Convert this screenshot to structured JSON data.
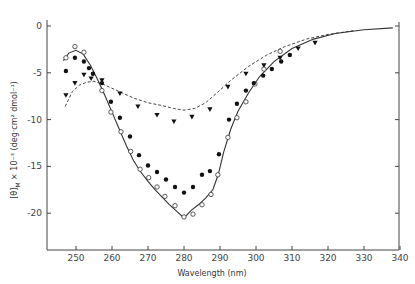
{
  "chart_data": {
    "type": "scatter",
    "title": "",
    "xlabel": "Wavelength (nm)",
    "ylabel": "[θ]M × 10⁻³ (deg·cm² dmol⁻¹)",
    "xlim": [
      242,
      340
    ],
    "ylim": [
      -24,
      2
    ],
    "x_ticks": [
      250,
      260,
      270,
      280,
      290,
      300,
      310,
      320,
      330,
      340
    ],
    "y_ticks": [
      0,
      -5,
      -10,
      -15,
      -20
    ],
    "grid": false,
    "legend": null,
    "series": [
      {
        "name": "open circles",
        "marker": "open-circle",
        "points": [
          [
            247.2,
            -3.4
          ],
          [
            249.7,
            -2.2
          ],
          [
            252.2,
            -2.8
          ],
          [
            257.2,
            -6.9
          ],
          [
            259.7,
            -9.2
          ],
          [
            262.5,
            -11.3
          ],
          [
            265.2,
            -13.4
          ],
          [
            267.8,
            -15.3
          ],
          [
            270.2,
            -16.2
          ],
          [
            272.5,
            -17.2
          ],
          [
            274.7,
            -18.2
          ],
          [
            277.5,
            -19.2
          ],
          [
            280,
            -20.4
          ],
          [
            282.5,
            -20.1
          ],
          [
            285,
            -19.1
          ],
          [
            287.5,
            -18
          ],
          [
            289.4,
            -15.9
          ],
          [
            292.2,
            -11.9
          ],
          [
            294.7,
            -9.8
          ],
          [
            297.2,
            -8.1
          ],
          [
            299.7,
            -6.2
          ],
          [
            302.2,
            -4.6
          ],
          [
            306.7,
            -2.7
          ]
        ]
      },
      {
        "name": "filled circles",
        "marker": "filled-circle",
        "points": [
          [
            247.2,
            -4.8
          ],
          [
            249.7,
            -3.4
          ],
          [
            252.2,
            -3.8
          ],
          [
            253.6,
            -4.5
          ],
          [
            254.7,
            -5.1
          ],
          [
            257.2,
            -6.1
          ],
          [
            259.7,
            -8.1
          ],
          [
            262.2,
            -9.8
          ],
          [
            265,
            -11.8
          ],
          [
            267.5,
            -13.8
          ],
          [
            270,
            -14.9
          ],
          [
            272.5,
            -15.6
          ],
          [
            275,
            -16.4
          ],
          [
            277.5,
            -17.2
          ],
          [
            280,
            -17.8
          ],
          [
            282.5,
            -17.2
          ],
          [
            285,
            -15.9
          ],
          [
            287.2,
            -15.5
          ],
          [
            289.7,
            -13.7
          ],
          [
            292.5,
            -10.0
          ],
          [
            294.7,
            -8.3
          ],
          [
            297.2,
            -6.9
          ],
          [
            299.4,
            -6.1
          ],
          [
            302,
            -5.3
          ],
          [
            304.4,
            -4.6
          ],
          [
            307,
            -3.8
          ],
          [
            309.4,
            -3.1
          ]
        ]
      },
      {
        "name": "filled triangles",
        "marker": "filled-triangle-down",
        "points": [
          [
            247.2,
            -7.4
          ],
          [
            249.7,
            -6.1
          ],
          [
            252.2,
            -5.2
          ],
          [
            254.2,
            -5.6
          ],
          [
            257.2,
            -5.8
          ],
          [
            262.2,
            -7.2
          ],
          [
            267.2,
            -8.6
          ],
          [
            272.5,
            -9.5
          ],
          [
            277.2,
            -10.2
          ],
          [
            282.2,
            -9.7
          ],
          [
            287.2,
            -8.9
          ],
          [
            292.2,
            -6.5
          ],
          [
            297.2,
            -5.1
          ],
          [
            302.2,
            -4.2
          ],
          [
            306.7,
            -3.4
          ],
          [
            311.7,
            -2.4
          ],
          [
            316.4,
            -1.8
          ]
        ]
      },
      {
        "name": "solid curve",
        "style": "solid",
        "points": [
          [
            246.5,
            -3.7
          ],
          [
            248,
            -2.9
          ],
          [
            250,
            -2.6
          ],
          [
            252,
            -3.0
          ],
          [
            254,
            -4.2
          ],
          [
            256,
            -5.7
          ],
          [
            258,
            -7.4
          ],
          [
            260,
            -9.2
          ],
          [
            262,
            -11.0
          ],
          [
            264,
            -12.8
          ],
          [
            266,
            -14.4
          ],
          [
            268,
            -15.6
          ],
          [
            270,
            -16.6
          ],
          [
            272,
            -17.5
          ],
          [
            274,
            -18.3
          ],
          [
            276,
            -19.1
          ],
          [
            278,
            -19.8
          ],
          [
            280,
            -20.5
          ],
          [
            282,
            -19.7
          ],
          [
            284,
            -19.1
          ],
          [
            286,
            -18.4
          ],
          [
            288,
            -17.5
          ],
          [
            289.5,
            -15.9
          ],
          [
            291,
            -13.5
          ],
          [
            293,
            -11.0
          ],
          [
            295,
            -9.1
          ],
          [
            298,
            -7.1
          ],
          [
            301,
            -5.4
          ],
          [
            305,
            -3.8
          ],
          [
            310,
            -2.4
          ],
          [
            316,
            -1.4
          ],
          [
            322,
            -0.8
          ],
          [
            330,
            -0.4
          ],
          [
            338,
            -0.2
          ]
        ]
      },
      {
        "name": "dashed curve",
        "style": "dashed",
        "points": [
          [
            247,
            -8.6
          ],
          [
            249,
            -7.0
          ],
          [
            251,
            -6.3
          ],
          [
            253,
            -6.0
          ],
          [
            255,
            -5.9
          ],
          [
            258,
            -6.3
          ],
          [
            262,
            -7.0
          ],
          [
            266,
            -7.7
          ],
          [
            270,
            -8.2
          ],
          [
            274,
            -8.5
          ],
          [
            277,
            -8.8
          ],
          [
            280,
            -9.0
          ],
          [
            283,
            -8.8
          ],
          [
            286,
            -8.2
          ],
          [
            289,
            -7.2
          ],
          [
            293,
            -5.8
          ],
          [
            298,
            -4.3
          ],
          [
            303,
            -3.1
          ],
          [
            308,
            -2.2
          ],
          [
            314,
            -1.4
          ],
          [
            320,
            -0.9
          ],
          [
            327,
            -0.5
          ]
        ]
      }
    ]
  },
  "axes": {
    "x_tick_labels": [
      "250",
      "260",
      "270",
      "280",
      "290",
      "300",
      "310",
      "320",
      "330",
      "340"
    ],
    "y_tick_labels": [
      "0",
      "-5",
      "-10",
      "-15",
      "-20"
    ],
    "xlabel": "Wavelength (nm)",
    "ylabel_main": "[θ]",
    "ylabel_sub": "M",
    "ylabel_rest": " × 10⁻³  (deg·cm² dmol⁻¹)"
  }
}
